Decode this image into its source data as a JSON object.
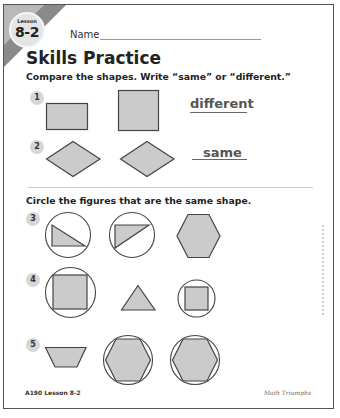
{
  "header": {
    "lesson_label": "Lesson",
    "lesson_number": "8-2",
    "name_label": "Name",
    "title": "Skills Practice"
  },
  "section1": {
    "instruction": "Compare the shapes. Write “same” or “different.”",
    "items": [
      {
        "number": "1",
        "shapes": [
          "rectangle",
          "square"
        ],
        "answer": "different"
      },
      {
        "number": "2",
        "shapes": [
          "rhombus",
          "rhombus"
        ],
        "answer": "same"
      }
    ]
  },
  "section2": {
    "instruction": "Circle the figures that are the same shape.",
    "items": [
      {
        "number": "3",
        "shapes": [
          "right-triangle (circled)",
          "right-triangle (circled)",
          "hexagon"
        ]
      },
      {
        "number": "4",
        "shapes": [
          "square (circled)",
          "triangle",
          "square (circled)"
        ]
      },
      {
        "number": "5",
        "shapes": [
          "trapezoid",
          "hexagon (circled)",
          "hexagon (circled)"
        ]
      }
    ]
  },
  "footer": {
    "page_ref": "A190   Lesson 8-2",
    "series": "Math Triumphs"
  },
  "colors": {
    "shape_fill": "#cbcbcb",
    "outline": "#444444",
    "corner_band": "#8a8a8a"
  }
}
